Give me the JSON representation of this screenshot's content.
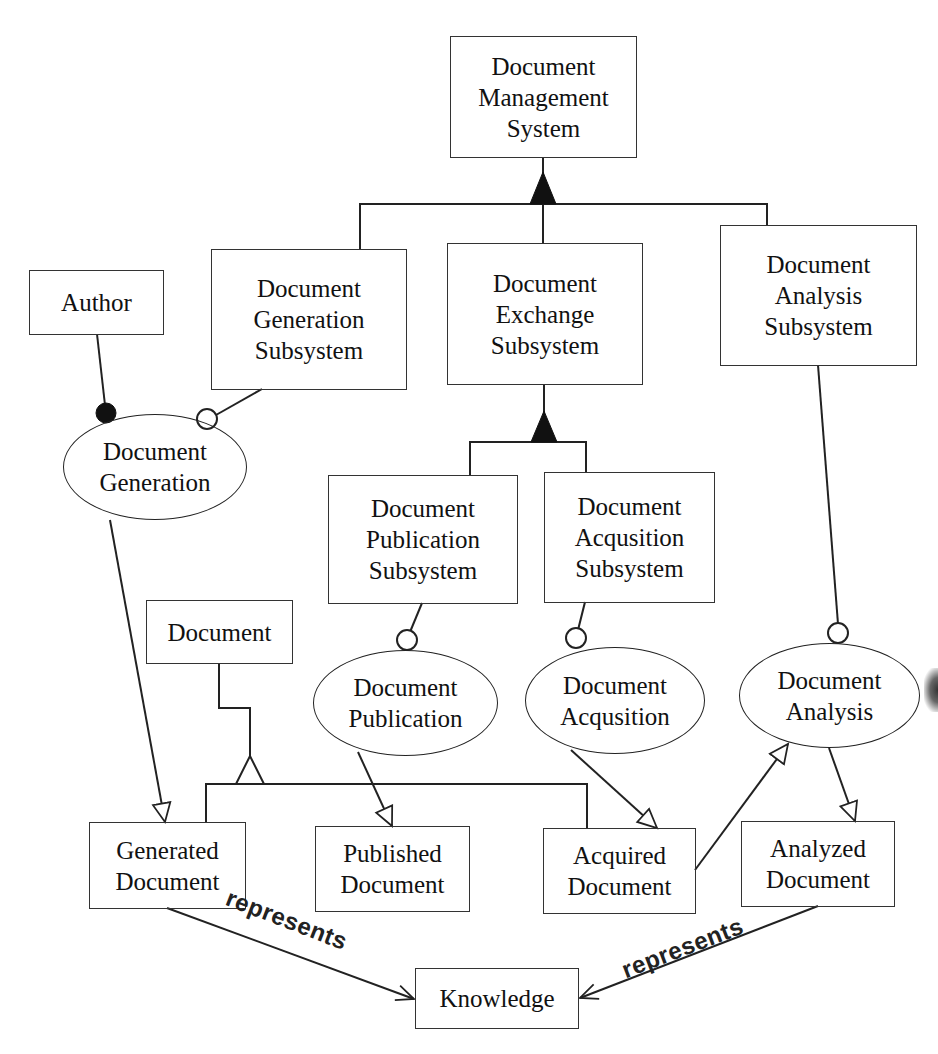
{
  "diagram": {
    "type": "UML-style object/process diagram",
    "nodes": {
      "dms": {
        "shape": "rect",
        "lines": [
          "Document",
          "Management",
          "System"
        ]
      },
      "dgs": {
        "shape": "rect",
        "lines": [
          "Document",
          "Generation",
          "Subsystem"
        ]
      },
      "des": {
        "shape": "rect",
        "lines": [
          "Document",
          "Exchange",
          "Subsystem"
        ]
      },
      "das": {
        "shape": "rect",
        "lines": [
          "Document",
          "Analysis",
          "Subsystem"
        ]
      },
      "author": {
        "shape": "rect",
        "lines": [
          "Author"
        ]
      },
      "dps": {
        "shape": "rect",
        "lines": [
          "Document",
          "Publication",
          "Subsystem"
        ]
      },
      "daqs": {
        "shape": "rect",
        "lines": [
          "Document",
          "Acqusition",
          "Subsystem"
        ]
      },
      "document": {
        "shape": "rect",
        "lines": [
          "Document"
        ]
      },
      "p_gen": {
        "shape": "ellipse",
        "lines": [
          "Document",
          "Generation"
        ]
      },
      "p_pub": {
        "shape": "ellipse",
        "lines": [
          "Document",
          "Publication"
        ]
      },
      "p_acq": {
        "shape": "ellipse",
        "lines": [
          "Document",
          "Acqusition"
        ]
      },
      "p_ana": {
        "shape": "ellipse",
        "lines": [
          "Document",
          "Analysis"
        ]
      },
      "gen_doc": {
        "shape": "rect",
        "lines": [
          "Generated",
          "Document"
        ]
      },
      "pub_doc": {
        "shape": "rect",
        "lines": [
          "Published",
          "Document"
        ]
      },
      "acq_doc": {
        "shape": "rect",
        "lines": [
          "Acquired",
          "Document"
        ]
      },
      "ana_doc": {
        "shape": "rect",
        "lines": [
          "Analyzed",
          "Document"
        ]
      },
      "knowledge": {
        "shape": "rect",
        "lines": [
          "Knowledge"
        ]
      }
    },
    "edges": [
      {
        "from": "dgs",
        "to": "dms",
        "type": "aggregation"
      },
      {
        "from": "des",
        "to": "dms",
        "type": "aggregation"
      },
      {
        "from": "das",
        "to": "dms",
        "type": "aggregation"
      },
      {
        "from": "dps",
        "to": "des",
        "type": "aggregation"
      },
      {
        "from": "daqs",
        "to": "des",
        "type": "aggregation"
      },
      {
        "from": "author",
        "to": "p_gen",
        "type": "agent"
      },
      {
        "from": "dgs",
        "to": "p_gen",
        "type": "instrument"
      },
      {
        "from": "dps",
        "to": "p_pub",
        "type": "instrument"
      },
      {
        "from": "daqs",
        "to": "p_acq",
        "type": "instrument"
      },
      {
        "from": "das",
        "to": "p_ana",
        "type": "instrument"
      },
      {
        "from": "p_gen",
        "to": "gen_doc",
        "type": "result"
      },
      {
        "from": "p_pub",
        "to": "pub_doc",
        "type": "result"
      },
      {
        "from": "p_acq",
        "to": "acq_doc",
        "type": "result"
      },
      {
        "from": "acq_doc",
        "to": "p_ana",
        "type": "consumption"
      },
      {
        "from": "p_ana",
        "to": "ana_doc",
        "type": "result"
      },
      {
        "from": "gen_doc",
        "to": "document",
        "type": "generalization"
      },
      {
        "from": "pub_doc",
        "to": "document",
        "type": "generalization"
      },
      {
        "from": "acq_doc",
        "to": "document",
        "type": "generalization"
      },
      {
        "from": "gen_doc",
        "to": "knowledge",
        "type": "tagged",
        "label": "represents"
      },
      {
        "from": "ana_doc",
        "to": "knowledge",
        "type": "tagged",
        "label": "represents"
      }
    ],
    "edge_labels": {
      "left": "represents",
      "right": "represents"
    }
  }
}
